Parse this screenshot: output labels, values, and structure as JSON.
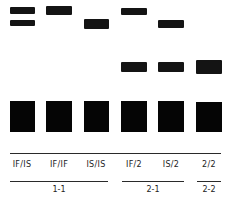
{
  "lanes": [
    {
      "label": "IF/IS"
    },
    {
      "label": "IF/IF"
    },
    {
      "label": "IS/IS"
    },
    {
      "label": "IF/2"
    },
    {
      "label": "IS/2"
    },
    {
      "label": "2/2"
    }
  ],
  "groups": [
    {
      "label": "1-1"
    },
    {
      "label": "2-1"
    },
    {
      "label": "2-2"
    }
  ],
  "colors": {
    "band": "#141414",
    "background": "#ffffff"
  }
}
